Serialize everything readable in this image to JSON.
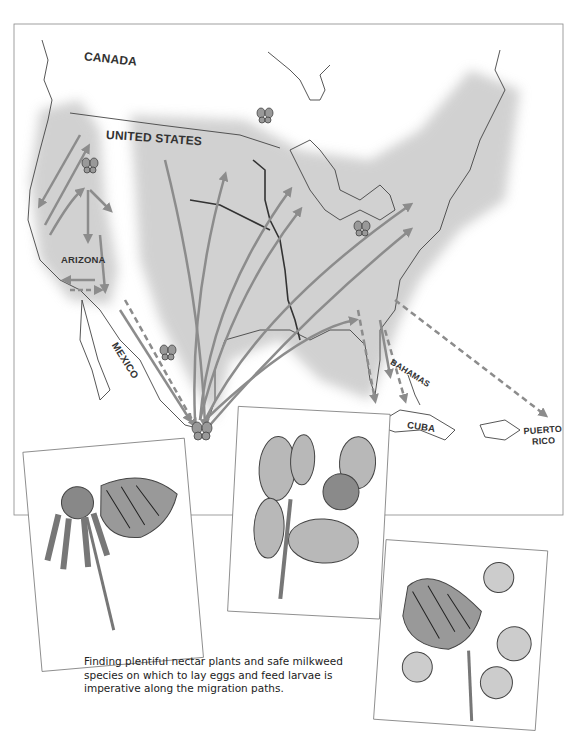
{
  "map": {
    "labels": {
      "canada": "CANADA",
      "united_states": "UNITED STATES",
      "arizona": "ARIZONA",
      "mexico": "MEXICO",
      "bahamas": "BAHAMAS",
      "cuba": "CUBA",
      "puerto_rico_line1": "PUERTO",
      "puerto_rico_line2": "RICO"
    },
    "colors": {
      "arrow": "#8c8c8c",
      "range_fill": "#c4c4c4",
      "coastline": "#444444",
      "frame": "#888888"
    }
  },
  "illustrations": [
    {
      "subject": "monarch butterfly on coneflower"
    },
    {
      "subject": "milkweed plant with flower cluster"
    },
    {
      "subject": "monarch butterfly on aster flowers"
    }
  ],
  "caption": {
    "line1": "Finding plentiful nectar plants and safe milkweed",
    "line2": "species on which to lay eggs and feed larvae is",
    "line3": "imperative along the migration paths."
  }
}
